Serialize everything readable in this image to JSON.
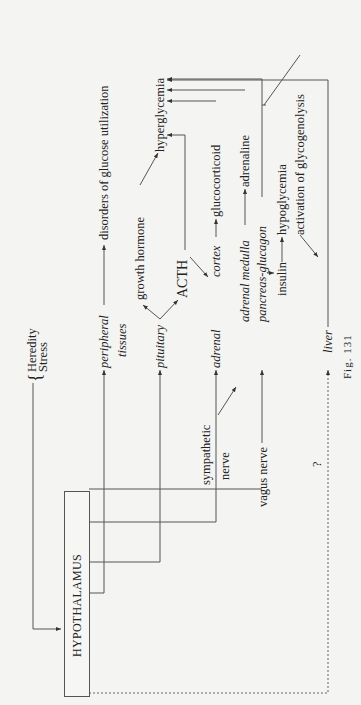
{
  "figure": {
    "caption": "Fig. 131",
    "center": "HYPOTHALAMUS",
    "inputs": [
      "Heredity",
      "Stress"
    ],
    "targets": {
      "peripheral": "peripheral",
      "tissues": "tissues",
      "pituitary": "pituitary",
      "adrenal_cortex_1": "adrenal",
      "adrenal_cortex_2": "cortex",
      "adrenal_medulla": "adrenal medulla",
      "pancreas": "pancreas-glucagon",
      "insulin": "insulin",
      "liver": "liver"
    },
    "nerves": {
      "sympathetic_1": "sympathetic",
      "sympathetic_2": "nerve",
      "vagus": "vagus nerve",
      "unknown": "?"
    },
    "effects": {
      "disorders": "disorders of glucose utilization",
      "growth_hormone": "growth hormone",
      "acth": "ACTH",
      "hyperglycemia": "hyperglycemia",
      "glucocorticoid": "glucocorticoid",
      "adrenaline": "adrenaline",
      "hypoglycemia": "hypoglycemia",
      "glycogenolysis": "activation of glycogenolysis"
    }
  }
}
